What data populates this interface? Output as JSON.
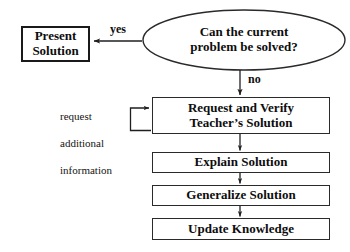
{
  "diagram": {
    "background_color": "#ffffff",
    "line_color": "#2a2a2a",
    "text_color": "#0d0d0d",
    "decision": {
      "id": "can-problem-be-solved",
      "shape": "ellipse",
      "line1": "Can the current",
      "line2": "problem be solved?"
    },
    "present_solution": {
      "id": "present-solution",
      "shape": "rect",
      "line1": "Present",
      "line2": "Solution"
    },
    "request_verify": {
      "id": "request-and-verify",
      "shape": "rect",
      "line1": "Request and Verify",
      "line2": "Teacher’s Solution"
    },
    "explain": {
      "id": "explain-solution",
      "shape": "rect",
      "label": "Explain Solution"
    },
    "generalize": {
      "id": "generalize-solution",
      "shape": "rect",
      "label": "Generalize Solution"
    },
    "update": {
      "id": "update-knowledge",
      "shape": "rect",
      "label": "Update Knowledge"
    },
    "edge_labels": {
      "yes": "yes",
      "no": "no"
    },
    "feedback_note": {
      "id": "request-additional-information",
      "line1": "request",
      "line2": "additional",
      "line3": "information",
      "text": "request\nadditional\ninformation"
    }
  }
}
